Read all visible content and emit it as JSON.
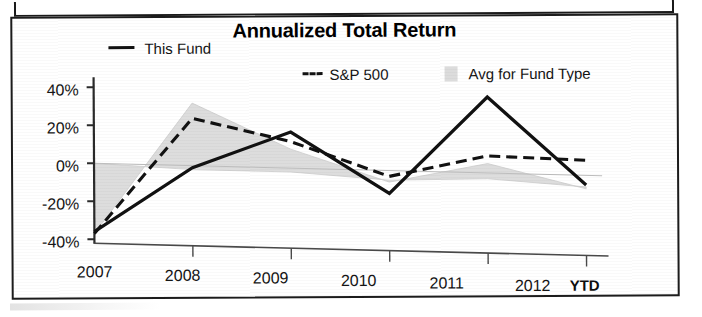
{
  "chart_data": {
    "type": "line",
    "title": "Annualized Total Return",
    "xlabel": "",
    "ylabel": "",
    "categories": [
      "2007",
      "2008",
      "2009",
      "2010",
      "2011",
      "2012"
    ],
    "x_axis_note": "YTD",
    "ylim": [
      -40,
      40
    ],
    "ytick_labels": [
      "40%",
      "20%",
      "0%",
      "-20%",
      "-40%"
    ],
    "ytick_values": [
      40,
      20,
      0,
      -20,
      -40
    ],
    "grid": false,
    "legend_position": "top",
    "series": [
      {
        "name": "This Fund",
        "style": "solid-line",
        "color": "#111111",
        "values": [
          -36,
          -1,
          19,
          -12,
          40,
          -5
        ]
      },
      {
        "name": "S&P 500",
        "style": "dashed-line",
        "color": "#111111",
        "values": [
          -37,
          25,
          14,
          -3,
          9,
          8
        ]
      },
      {
        "name": "Avg for Fund Type",
        "style": "filled-area",
        "color": "#dcdcdc",
        "values": [
          -37,
          33,
          10,
          -6,
          5,
          -7
        ]
      }
    ],
    "baseline_series": {
      "name": "zero-baseline-band",
      "values": [
        0,
        -2,
        -2,
        -5,
        -3,
        -6
      ]
    }
  },
  "legend": {
    "items": [
      {
        "label": "This Fund",
        "marker": "solid-line-swatch"
      },
      {
        "label": "S&P 500",
        "marker": "dashed-line-swatch"
      },
      {
        "label": "Avg for Fund Type",
        "marker": "gray-area-swatch"
      }
    ]
  },
  "axis": {
    "y_ticks": [
      "40%",
      "20%",
      "0%",
      "-20%",
      "-40%"
    ],
    "x_ticks": [
      "2007",
      "2008",
      "2009",
      "2010",
      "2011",
      "2012"
    ],
    "x_suffix": "YTD"
  },
  "colors": {
    "line": "#111111",
    "area_fill": "#dcdcdc",
    "frame": "#1c1c1c",
    "text": "#141414",
    "background": "#ffffff"
  }
}
